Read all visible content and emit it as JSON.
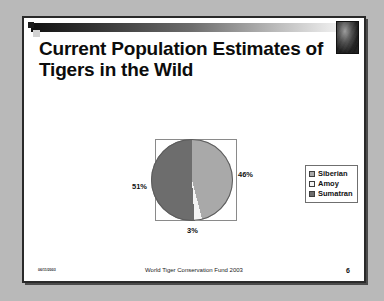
{
  "slide": {
    "title": "Current Population Estimates of Tigers in the Wild",
    "tiger_photo_name": "tiger-photo",
    "footer": {
      "date": "06/11/2003",
      "center": "World Tiger Conservation Fund 2003",
      "page_number": "6"
    }
  },
  "chart_data": {
    "type": "pie",
    "title": "Current Population Estimates of Tigers in the Wild",
    "categories": [
      "Siberian",
      "Amoy",
      "Sumatran"
    ],
    "values": [
      46,
      3,
      51
    ],
    "labels": [
      "46%",
      "3%",
      "51%"
    ],
    "colors": [
      "#a9a9a9",
      "#f4f4f4",
      "#6d6d6d"
    ],
    "legend_position": "right",
    "grid": false,
    "xlabel": "",
    "ylabel": ""
  },
  "legend": {
    "items": [
      {
        "label": "Siberian",
        "color": "#a9a9a9"
      },
      {
        "label": "Amoy",
        "color": "#f4f4f4"
      },
      {
        "label": "Sumatran",
        "color": "#6d6d6d"
      }
    ]
  },
  "percent_labels": {
    "left": "51%",
    "right": "46%",
    "bottom": "3%"
  }
}
